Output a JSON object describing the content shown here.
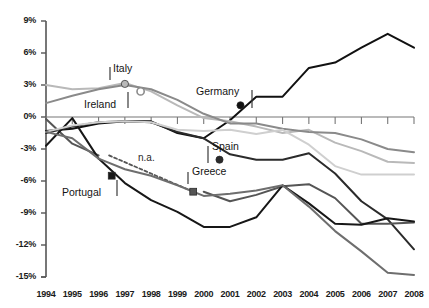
{
  "chart_data": {
    "type": "line",
    "title": "",
    "xlabel": "",
    "ylabel": "",
    "grid": false,
    "legend_position": "inline-annotations",
    "xlim": [
      1994,
      2008
    ],
    "ylim": [
      -15,
      9
    ],
    "ytick_step": 3,
    "x": [
      1994,
      1995,
      1996,
      1997,
      1998,
      1999,
      2000,
      2001,
      2002,
      2003,
      2004,
      2005,
      2006,
      2007,
      2008
    ],
    "categories": [
      "1994",
      "1995",
      "1996",
      "1997",
      "1998",
      "1999",
      "2000",
      "2001",
      "2002",
      "2003",
      "2004",
      "2005",
      "2006",
      "2007",
      "2008"
    ],
    "ytick_labels": [
      "9%",
      "6%",
      "3%",
      "0%",
      "-3%",
      "-6%",
      "-9%",
      "-12%",
      "-15%"
    ],
    "ytick_values": [
      9,
      6,
      3,
      0,
      -3,
      -6,
      -9,
      -12,
      -15
    ],
    "series": [
      {
        "name": "Germany",
        "color": "#111111",
        "values": [
          -1.3,
          -1.1,
          -0.6,
          -0.4,
          -0.4,
          -1.5,
          -2.0,
          -0.3,
          1.9,
          1.9,
          4.6,
          5.1,
          6.5,
          7.8,
          6.5
        ],
        "marker": {
          "x": 2001.4,
          "y": 1.1,
          "shape": "circle-filled"
        },
        "label": "Germany",
        "label_pos": {
          "x": 196,
          "y": 85
        },
        "leader": {
          "x1": 252,
          "y1": 90,
          "x2": 252,
          "y2": 108
        }
      },
      {
        "name": "Italy",
        "color": "#b9b9b9",
        "values": [
          3.0,
          2.6,
          2.7,
          3.2,
          2.4,
          1.1,
          -0.1,
          -0.4,
          -0.9,
          -1.5,
          -1.2,
          -2.4,
          -3.2,
          -4.2,
          -4.3
        ],
        "marker": {
          "x": 1997.0,
          "y": 3.1,
          "shape": "circle-filled"
        },
        "label": "Italy",
        "label_pos": {
          "x": 113,
          "y": 62
        },
        "leader": {
          "x1": 110,
          "y1": 67,
          "x2": 110,
          "y2": 80
        }
      },
      {
        "name": "Ireland",
        "color": "#8a8a8a",
        "values": [
          1.3,
          2.0,
          2.6,
          3.0,
          2.6,
          1.6,
          0.3,
          -0.6,
          -0.6,
          -1.1,
          -1.4,
          -1.5,
          -2.1,
          -3.0,
          -3.3
        ],
        "marker": {
          "x": 1997.6,
          "y": 2.4,
          "shape": "circle-hollow"
        },
        "label": "Ireland",
        "label_pos": {
          "x": 84,
          "y": 98
        },
        "leader": {
          "x1": 128,
          "y1": 92,
          "x2": 128,
          "y2": 108
        }
      },
      {
        "name": "Spain",
        "color": "#2b2b2b",
        "values": [
          -1.5,
          -0.9,
          -0.5,
          -0.4,
          -0.5,
          -1.4,
          -2.0,
          -3.5,
          -4.0,
          -4.0,
          -3.4,
          -5.3,
          -7.9,
          -9.6,
          -12.4
        ],
        "marker": {
          "x": 2000.6,
          "y": -4.0,
          "shape": "circle-filled"
        },
        "label": "Spain",
        "label_pos": {
          "x": 212,
          "y": 140
        },
        "leader": {
          "x1": 208,
          "y1": 146,
          "x2": 208,
          "y2": 163
        }
      },
      {
        "name": "Greece",
        "color": "#555555",
        "values": [
          -0.2,
          -2.5,
          -3.6,
          -4.3,
          -4.8,
          -5.5,
          -7.0,
          -7.9,
          -7.3,
          -6.5,
          -6.3,
          -7.6,
          -10.0,
          -10.0,
          -9.9
        ],
        "marker": {
          "x": 1999.6,
          "y": -7.0,
          "shape": "square-filled"
        },
        "label": "Greece",
        "label_pos": {
          "x": 192,
          "y": 165
        },
        "leader": {
          "x1": 188,
          "y1": 172,
          "x2": 188,
          "y2": 184
        },
        "na_segment": {
          "from": 1996.4,
          "to": 1999.6,
          "note": "n.a."
        },
        "na_label": "n.a.",
        "na_label_pos": {
          "x": 138,
          "y": 152
        }
      },
      {
        "name": "Portugal",
        "color": "#171717",
        "values": [
          -2.7,
          -0.1,
          -3.9,
          -6.2,
          -7.8,
          -8.9,
          -10.3,
          -10.3,
          -9.4,
          -6.4,
          -8.1,
          -10.0,
          -10.1,
          -9.5,
          -9.8
        ],
        "marker": {
          "x": 1996.5,
          "y": -5.5,
          "shape": "square-filled"
        },
        "label": "Portugal",
        "label_pos": {
          "x": 62,
          "y": 186
        },
        "leader": {
          "x1": 117,
          "y1": 180,
          "x2": 117,
          "y2": 196
        }
      },
      {
        "name": "Unlabeled-light",
        "color": "#cfcfcf",
        "values": [
          -1.4,
          -0.8,
          -0.5,
          -0.4,
          -0.5,
          -1.2,
          -1.3,
          -1.2,
          -1.6,
          -1.2,
          -2.6,
          -4.6,
          -5.4,
          -5.4,
          -5.4
        ],
        "label": "",
        "label_pos": null
      },
      {
        "name": "Unlabeled-mid",
        "color": "#6e6e6e",
        "values": [
          -1.4,
          -2.0,
          -3.9,
          -4.9,
          -5.5,
          -6.4,
          -7.4,
          -7.2,
          -6.9,
          -6.4,
          -8.4,
          -10.7,
          -12.6,
          -14.6,
          -14.8
        ],
        "label": "",
        "label_pos": null
      }
    ],
    "annotations": [
      "Italy",
      "Ireland",
      "Germany",
      "Spain",
      "Greece",
      "Portugal",
      "n.a."
    ]
  },
  "axis": {
    "y_axis_name": "percent-axis",
    "x_axis_name": "year-axis"
  }
}
